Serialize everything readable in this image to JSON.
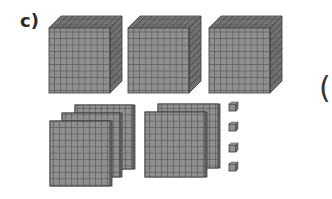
{
  "exercise": {
    "label": "c)",
    "next_paren": "("
  },
  "blocks": {
    "thousands_cubes": 3,
    "hundreds_flats_group1": 3,
    "hundreds_flats_group2": 2,
    "units": 4
  },
  "colors": {
    "block_fill": "#8f8f8f",
    "block_top": "#a3a3a3",
    "block_side": "#6f6f6f",
    "grid_line": "#3a3a3a"
  }
}
